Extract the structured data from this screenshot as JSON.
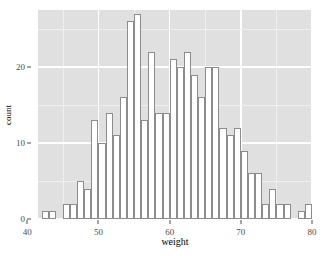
{
  "chart_data": {
    "type": "bar",
    "subtype": "histogram",
    "title": "",
    "xlabel": "weight",
    "ylabel": "count",
    "xlim": [
      41.5,
      80.0
    ],
    "ylim": [
      0,
      27.5
    ],
    "xticks": [
      40,
      50,
      60,
      70,
      80
    ],
    "yticks": [
      0,
      10,
      20
    ],
    "xtick_labels": [
      "40",
      "50",
      "60",
      "70",
      "80"
    ],
    "ytick_labels": [
      "0",
      "10",
      "20"
    ],
    "grid": "white major and minor gridlines on grey panel",
    "legend": "none",
    "binwidth": 1,
    "bin_starts": [
      42,
      43,
      44,
      45,
      46,
      47,
      48,
      49,
      50,
      51,
      52,
      53,
      54,
      55,
      56,
      57,
      58,
      59,
      60,
      61,
      62,
      63,
      64,
      65,
      66,
      67,
      68,
      69,
      70,
      71,
      72,
      73,
      74,
      75,
      76,
      77,
      78,
      79
    ],
    "categories": [
      "42",
      "43",
      "44",
      "45",
      "46",
      "47",
      "48",
      "49",
      "50",
      "51",
      "52",
      "53",
      "54",
      "55",
      "56",
      "57",
      "58",
      "59",
      "60",
      "61",
      "62",
      "63",
      "64",
      "65",
      "66",
      "67",
      "68",
      "69",
      "70",
      "71",
      "72",
      "73",
      "74",
      "75",
      "76",
      "77",
      "78",
      "79"
    ],
    "values": [
      1,
      1,
      0,
      2,
      2,
      5,
      4,
      13,
      10,
      14,
      11,
      16,
      26,
      27,
      13,
      22,
      14,
      14,
      21,
      20,
      22,
      19,
      16,
      20,
      20,
      12,
      11,
      12,
      9,
      6,
      6,
      2,
      4,
      2,
      2,
      0,
      1,
      2
    ]
  },
  "axis": {
    "x_title": "weight",
    "y_title": "count"
  },
  "colors": {
    "panel_background": "#e0e0e0",
    "grid_major": "#ffffff",
    "grid_minor": "#efefef",
    "bar_fill": "#ffffff",
    "bar_outline": "#8c8c8c",
    "tick_label": "#4d4d4d",
    "page_background": "#ffffff"
  },
  "caption": ""
}
